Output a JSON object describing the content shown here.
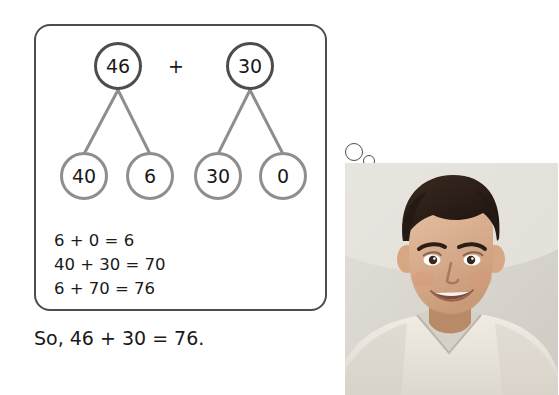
{
  "worksheet": {
    "title": "Number bond addition worked example",
    "thought_box": {
      "bonds": [
        {
          "name": "first-addend-bond",
          "top": "46",
          "left_leaf": "40",
          "right_leaf": "6"
        },
        {
          "name": "second-addend-bond",
          "top": "30",
          "left_leaf": "30",
          "right_leaf": "0"
        }
      ],
      "operator": "+",
      "equations": [
        "6 + 0 = 6",
        "40 + 30 = 70",
        "6 + 70 = 76"
      ]
    },
    "conclusion": "So, 46 + 30 = 76.",
    "thought_dots": [
      "large-bubble-dot",
      "small-bubble-dot"
    ],
    "photo": {
      "label": "photo-of-smiling-boy",
      "alt": "Young boy with dark hair smiling"
    },
    "colors": {
      "box_border": "#4d4d4d",
      "node_top_border": "#4d4d4d",
      "node_leaf_border": "#8e8e8e",
      "connector": "#8e8e8e",
      "text": "#1a1a1a",
      "background": "#ffffff"
    }
  }
}
